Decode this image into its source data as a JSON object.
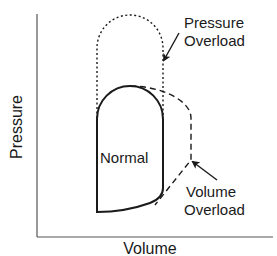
{
  "diagram": {
    "axes": {
      "y_label": "Pressure",
      "x_label": "Volume"
    },
    "loops": {
      "normal": {
        "label": "Normal",
        "style": "solid"
      },
      "pressure_overload": {
        "label_line1": "Pressure",
        "label_line2": "Overload",
        "style": "dotted"
      },
      "volume_overload": {
        "label_line1": "Volume",
        "label_line2": "Overload",
        "style": "dashed"
      }
    },
    "colors": {
      "line": "#1a1a1a",
      "axis": "#555555",
      "background": "#ffffff"
    }
  }
}
